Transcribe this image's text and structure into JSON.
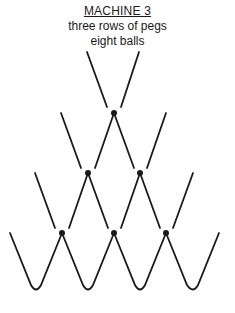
{
  "title": "MACHINE  3",
  "subtitle_lines": [
    "three rows of pegs",
    "eight balls"
  ],
  "diagram": {
    "rows_of_pegs": 3,
    "pegs": [
      [
        114,
        113
      ],
      [
        88,
        173
      ],
      [
        140,
        173
      ],
      [
        62,
        233
      ],
      [
        114,
        233
      ],
      [
        166,
        233
      ]
    ],
    "bins": 4,
    "line_color": "#1a1a1a"
  }
}
